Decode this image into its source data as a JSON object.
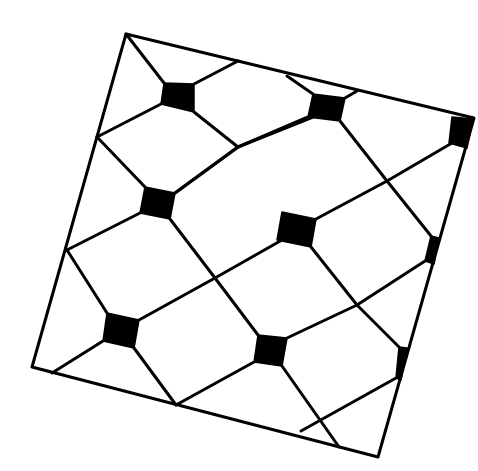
{
  "figure": {
    "colors": {
      "line": "#000000",
      "tile": "#000000",
      "background": "#ffffff"
    },
    "frame": {
      "shape": "rotated-square",
      "corners": [
        [
          126,
          34
        ],
        [
          474,
          118
        ],
        [
          378,
          457
        ],
        [
          32,
          367
        ]
      ]
    },
    "tiles": [
      {
        "id": "A",
        "points": [
          [
            164,
            83
          ],
          [
            194,
            84
          ],
          [
            194,
            112
          ],
          [
            161,
            104
          ]
        ]
      },
      {
        "id": "B",
        "points": [
          [
            313,
            94
          ],
          [
            345,
            98
          ],
          [
            340,
            121
          ],
          [
            308,
            117
          ]
        ]
      },
      {
        "id": "C",
        "points": [
          [
            452,
            117
          ],
          [
            473,
            119
          ],
          [
            467,
            148
          ],
          [
            449,
            143
          ]
        ]
      },
      {
        "id": "D",
        "points": [
          [
            145,
            187
          ],
          [
            175,
            193
          ],
          [
            170,
            219
          ],
          [
            140,
            213
          ]
        ]
      },
      {
        "id": "E",
        "points": [
          [
            282,
            212
          ],
          [
            316,
            219
          ],
          [
            311,
            247
          ],
          [
            277,
            240
          ]
        ]
      },
      {
        "id": "F",
        "points": [
          [
            431,
            236
          ],
          [
            439,
            238
          ],
          [
            434,
            264
          ],
          [
            425,
            261
          ]
        ]
      },
      {
        "id": "G",
        "points": [
          [
            107,
            313
          ],
          [
            139,
            320
          ],
          [
            134,
            348
          ],
          [
            103,
            341
          ]
        ]
      },
      {
        "id": "H",
        "points": [
          [
            258,
            335
          ],
          [
            287,
            338
          ],
          [
            282,
            366
          ],
          [
            254,
            362
          ]
        ]
      },
      {
        "id": "I",
        "points": [
          [
            399,
            347
          ],
          [
            407,
            348
          ],
          [
            401,
            380
          ],
          [
            396,
            378
          ]
        ]
      }
    ],
    "lines": [
      [
        [
          126,
          34
        ],
        [
          164,
          83
        ]
      ],
      [
        [
          194,
          84
        ],
        [
          238,
          61
        ]
      ],
      [
        [
          194,
          112
        ],
        [
          238,
          147
        ]
      ],
      [
        [
          161,
          104
        ],
        [
          97,
          137
        ]
      ],
      [
        [
          97,
          137
        ],
        [
          145,
          187
        ]
      ],
      [
        [
          238,
          147
        ],
        [
          175,
          193
        ]
      ],
      [
        [
          238,
          147
        ],
        [
          313,
          117
        ]
      ],
      [
        [
          287,
          76
        ],
        [
          313,
          94
        ]
      ],
      [
        [
          345,
          98
        ],
        [
          357,
          91
        ]
      ],
      [
        [
          340,
          121
        ],
        [
          387,
          181
        ]
      ],
      [
        [
          308,
          117
        ],
        [
          238,
          147
        ]
      ],
      [
        [
          387,
          181
        ],
        [
          452,
          143
        ]
      ],
      [
        [
          387,
          181
        ],
        [
          431,
          236
        ]
      ],
      [
        [
          387,
          181
        ],
        [
          316,
          219
        ]
      ],
      [
        [
          175,
          193
        ],
        [
          238,
          147
        ]
      ],
      [
        [
          170,
          219
        ],
        [
          215,
          278
        ]
      ],
      [
        [
          140,
          213
        ],
        [
          67,
          250
        ]
      ],
      [
        [
          67,
          250
        ],
        [
          107,
          313
        ]
      ],
      [
        [
          215,
          278
        ],
        [
          282,
          240
        ]
      ],
      [
        [
          215,
          278
        ],
        [
          139,
          320
        ]
      ],
      [
        [
          215,
          278
        ],
        [
          258,
          335
        ]
      ],
      [
        [
          311,
          247
        ],
        [
          357,
          305
        ]
      ],
      [
        [
          357,
          305
        ],
        [
          425,
          261
        ]
      ],
      [
        [
          357,
          305
        ],
        [
          399,
          347
        ]
      ],
      [
        [
          357,
          305
        ],
        [
          287,
          338
        ]
      ],
      [
        [
          103,
          341
        ],
        [
          52,
          373
        ]
      ],
      [
        [
          134,
          348
        ],
        [
          176,
          405
        ]
      ],
      [
        [
          254,
          362
        ],
        [
          176,
          405
        ]
      ],
      [
        [
          282,
          366
        ],
        [
          339,
          447
        ]
      ],
      [
        [
          396,
          378
        ],
        [
          301,
          431
        ]
      ]
    ]
  }
}
